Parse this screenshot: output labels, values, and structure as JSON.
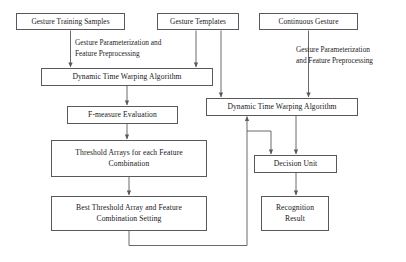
{
  "diagram": {
    "stroke_color": "#59595b",
    "text_color": "#17171a",
    "background": "#ffffff"
  },
  "nodes": {
    "gesture_training_samples": {
      "line1": "Gesture Training Samples"
    },
    "gesture_templates": {
      "line1": "Gesture Templates"
    },
    "continuous_gesture": {
      "line1": "Continuous Gesture"
    },
    "dtw_left": {
      "line1": "Dynamic Time Warping Algorithm"
    },
    "dtw_right": {
      "line1": "Dynamic Time Warping Algorithm"
    },
    "fmeasure": {
      "line1": "F-measure Evaluation"
    },
    "threshold_arrays": {
      "line1": "Threshold Arrays for each Feature",
      "line2": "Combination"
    },
    "best_threshold": {
      "line1": "Best Threshold Array and Feature",
      "line2": "Combination Setting"
    },
    "decision_unit": {
      "line1": "Decision Unit"
    },
    "recognition_result": {
      "line1": "Recognition",
      "line2": "Result"
    }
  },
  "labels": {
    "left_preprocessing": {
      "line1": "Gesture Parameterization and",
      "line2": "Feature Preprocessing"
    },
    "right_preprocessing": {
      "line1": "Gesture Parameterization",
      "line2": "and Feature Preprocessing"
    }
  }
}
